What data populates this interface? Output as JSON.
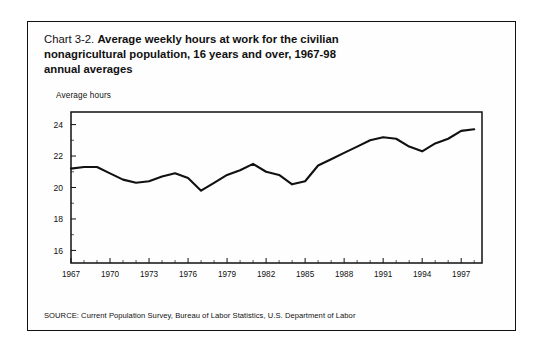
{
  "figure": {
    "title_prefix": "Chart 3-2.",
    "title_bold_line1": "Average weekly hours at work for the civilian",
    "title_bold_line2": "nonagricultural population, 16 years and over, 1967-98",
    "title_bold_line3": "annual averages",
    "axis_title": "Average hours",
    "source": "SOURCE: Current Population Survey, Bureau of Labor Statistics, U.S. Department of Labor",
    "line_color": "#111111",
    "background_color": "#ffffff"
  },
  "chart_data": {
    "type": "line",
    "title": "Chart 3-2. Average weekly hours at work for the civilian nonagricultural population, 16 years and over, 1967-98 annual averages",
    "xlabel": "",
    "ylabel": "Average hours",
    "x": [
      1967,
      1968,
      1969,
      1970,
      1971,
      1972,
      1973,
      1974,
      1975,
      1976,
      1977,
      1978,
      1979,
      1980,
      1981,
      1982,
      1983,
      1984,
      1985,
      1986,
      1987,
      1988,
      1989,
      1990,
      1991,
      1992,
      1993,
      1994,
      1995,
      1996,
      1997,
      1998
    ],
    "values": [
      21.2,
      21.3,
      21.3,
      20.9,
      20.5,
      20.3,
      20.4,
      20.7,
      20.9,
      20.6,
      19.8,
      20.3,
      20.8,
      21.1,
      21.5,
      21.0,
      20.8,
      20.2,
      20.4,
      21.4,
      21.8,
      22.2,
      22.6,
      23.0,
      23.2,
      23.1,
      22.6,
      22.3,
      22.8,
      23.1,
      23.6,
      23.7
    ],
    "series": [
      {
        "name": "Average weekly hours at work",
        "values": [
          21.2,
          21.3,
          21.3,
          20.9,
          20.5,
          20.3,
          20.4,
          20.7,
          20.9,
          20.6,
          19.8,
          20.3,
          20.8,
          21.1,
          21.5,
          21.0,
          20.8,
          20.2,
          20.4,
          21.4,
          21.8,
          22.2,
          22.6,
          23.0,
          23.2,
          23.1,
          22.6,
          22.3,
          22.8,
          23.1,
          23.6,
          23.7
        ]
      }
    ],
    "ylim": [
      15.2,
      24.8
    ],
    "xlim": [
      1967,
      1998.6
    ],
    "yticks": [
      16,
      18,
      20,
      22,
      24
    ],
    "ytick_labels": [
      "16",
      "18",
      "20",
      "22",
      "24"
    ],
    "xticks": [
      1967,
      1970,
      1973,
      1976,
      1979,
      1982,
      1985,
      1988,
      1991,
      1994,
      1997
    ],
    "xtick_labels": [
      "1967",
      "1970",
      "1973",
      "1976",
      "1979",
      "1982",
      "1985",
      "1988",
      "1991",
      "1994",
      "1997"
    ],
    "grid": false,
    "legend": false
  }
}
